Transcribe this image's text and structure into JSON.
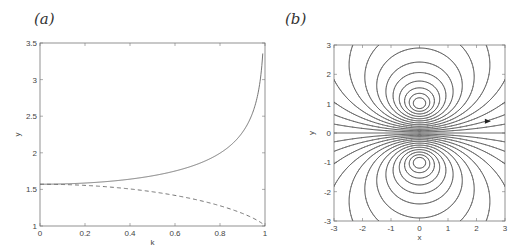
{
  "chart_data": [
    {
      "panel": "(a)",
      "type": "line",
      "title": "",
      "xlabel": "k",
      "ylabel": "y",
      "xlim": [
        0,
        1
      ],
      "ylim": [
        1,
        3.5
      ],
      "xticks": [
        0,
        0.2,
        0.4,
        0.6,
        0.8,
        1
      ],
      "xtick_labels": [
        "0",
        "0.2",
        "0.4",
        "0.6",
        "0.8",
        "1"
      ],
      "yticks": [
        1,
        1.5,
        2,
        2.5,
        3,
        3.5
      ],
      "ytick_labels": [
        "1",
        "1.5",
        "2",
        "2.5",
        "3",
        "3.5"
      ],
      "grid": false,
      "legend": null,
      "series": [
        {
          "name": "solid curve (increasing, K(k)-like)",
          "style": "solid",
          "x": [
            0,
            0.1,
            0.2,
            0.3,
            0.4,
            0.5,
            0.6,
            0.7,
            0.8,
            0.85,
            0.9,
            0.95,
            0.98,
            0.995
          ],
          "values": [
            1.571,
            1.575,
            1.587,
            1.608,
            1.64,
            1.686,
            1.751,
            1.846,
            1.995,
            2.103,
            2.281,
            2.591,
            3.0,
            3.4
          ]
        },
        {
          "name": "dashed curve (decreasing, E(k)-like)",
          "style": "dashed",
          "x": [
            0,
            0.1,
            0.2,
            0.3,
            0.4,
            0.5,
            0.6,
            0.7,
            0.8,
            0.9,
            0.95,
            1
          ],
          "values": [
            1.571,
            1.567,
            1.555,
            1.535,
            1.506,
            1.467,
            1.418,
            1.355,
            1.276,
            1.171,
            1.104,
            1.0
          ]
        }
      ]
    },
    {
      "panel": "(b)",
      "type": "contour",
      "title": "",
      "xlabel": "x",
      "ylabel": "y",
      "xlim": [
        -3,
        3
      ],
      "ylim": [
        -3,
        3
      ],
      "xticks": [
        -3,
        -2,
        -1,
        0,
        1,
        2,
        3
      ],
      "xtick_labels": [
        "-3",
        "-2",
        "-1",
        "0",
        "1",
        "2",
        "3"
      ],
      "yticks": [
        -3,
        -2,
        -1,
        0,
        1,
        2,
        3
      ],
      "ytick_labels": [
        "-3",
        "-2",
        "-1",
        "0",
        "1",
        "2",
        "3"
      ],
      "grid": false,
      "description": "Family of closed contour lines nested around the points (0,1) and (0,-1), symmetric about y=0, with the line y=0 drawn as a straight contour; an arrow marker near (2.4, 0.4) points right.",
      "contour_centers": [
        [
          0,
          1
        ],
        [
          0,
          -1
        ]
      ],
      "contour_levels": [
        0.08,
        0.16,
        0.25,
        0.35,
        0.46,
        0.58,
        0.72,
        0.88,
        1.06,
        1.28,
        1.55,
        1.9,
        2.4
      ],
      "arrow": {
        "x": 2.4,
        "y": 0.4,
        "direction": "right"
      }
    }
  ],
  "labels": {
    "panel_a": "(a)",
    "panel_b": "(b)"
  }
}
